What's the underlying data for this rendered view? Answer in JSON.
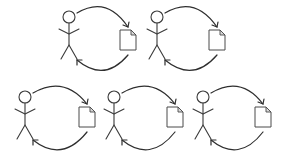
{
  "diagram": {
    "background": "#ffffff",
    "stroke_color": "#3a3a3a",
    "cycles": [
      {
        "id": "cycle-1",
        "row": "top",
        "figure": {
          "x": 69,
          "y": 17
        },
        "document": {
          "x": 120,
          "y": 30
        }
      },
      {
        "id": "cycle-2",
        "row": "top",
        "figure": {
          "x": 157,
          "y": 17
        },
        "document": {
          "x": 209,
          "y": 30
        }
      },
      {
        "id": "cycle-3",
        "row": "bottom",
        "figure": {
          "x": 25,
          "y": 97
        },
        "document": {
          "x": 79,
          "y": 107
        }
      },
      {
        "id": "cycle-4",
        "row": "bottom",
        "figure": {
          "x": 114,
          "y": 97
        },
        "document": {
          "x": 167,
          "y": 107
        }
      },
      {
        "id": "cycle-5",
        "row": "bottom",
        "figure": {
          "x": 203,
          "y": 97
        },
        "document": {
          "x": 255,
          "y": 107
        }
      }
    ],
    "icons": {
      "figure": "stick-figure-icon",
      "document": "document-icon",
      "arrow": "curved-arrow-icon"
    }
  }
}
